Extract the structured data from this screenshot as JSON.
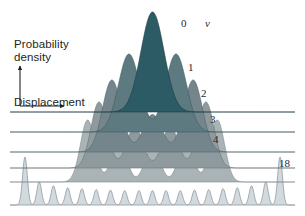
{
  "figure": {
    "background_color": "#ffffff",
    "axes": {
      "y_label": "Probability\ndensity",
      "y_label_line1": "Probability",
      "y_label_line2": "density",
      "x_label": "Displacement",
      "axis_color": "#231f20",
      "y_arrow_icon": "up-arrow-icon",
      "x_arrow_icon": "right-arrow-icon"
    },
    "quantum_number_symbol": "v",
    "labels": [
      {
        "text": "0",
        "x": 181,
        "y": 18,
        "name": "curve-label-v0"
      },
      {
        "text": "v",
        "x": 205,
        "y": 18,
        "name": "quantum-number-symbol",
        "italic": true
      },
      {
        "text": "1",
        "x": 188,
        "y": 62,
        "name": "curve-label-v1"
      },
      {
        "text": "2",
        "x": 201,
        "y": 88,
        "name": "curve-label-v2"
      },
      {
        "text": "3",
        "x": 210,
        "y": 114,
        "name": "curve-label-v3"
      },
      {
        "text": "4",
        "x": 213,
        "y": 134,
        "name": "curve-label-v4"
      },
      {
        "text": "18",
        "x": 279,
        "y": 158,
        "name": "curve-label-v18"
      }
    ]
  },
  "chart_data": {
    "type": "area",
    "xlabel": "Displacement",
    "ylabel": "Probability density",
    "grid": false,
    "legend": "inline right-edge labels",
    "xlim": [
      -1.0,
      1.0
    ],
    "ylim": [
      0,
      1
    ],
    "quantum_number_symbol": "v",
    "series": [
      {
        "name": "0",
        "v": 0,
        "lobes": 1,
        "fill_color": "#2c5b66",
        "stroke_color": "#1d3d45",
        "baseline_y": 112,
        "peak_height": 100,
        "half_width": 0.115,
        "peak_positions": [
          0.0
        ],
        "peak_amplitudes": [
          1.0
        ]
      },
      {
        "name": "1",
        "v": 1,
        "lobes": 2,
        "fill_color": "#5d7a80",
        "stroke_color": "#3e5c63",
        "baseline_y": 132,
        "peak_height": 78,
        "half_width": 0.105,
        "peak_positions": [
          -0.165,
          0.165
        ],
        "peak_amplitudes": [
          1.0,
          1.0
        ]
      },
      {
        "name": "2",
        "v": 2,
        "lobes": 3,
        "fill_color": "#74868c",
        "stroke_color": "#52676e",
        "baseline_y": 152,
        "peak_height": 72,
        "half_width": 0.093,
        "peak_positions": [
          -0.285,
          0.0,
          0.285
        ],
        "peak_amplitudes": [
          1.0,
          0.52,
          1.0
        ]
      },
      {
        "name": "3",
        "v": 3,
        "lobes": 4,
        "fill_color": "#8e9a9e",
        "stroke_color": "#687579",
        "baseline_y": 168,
        "peak_height": 66,
        "half_width": 0.081,
        "peak_positions": [
          -0.375,
          -0.125,
          0.125,
          0.375
        ],
        "peak_amplitudes": [
          1.0,
          0.62,
          0.62,
          1.0
        ]
      },
      {
        "name": "4",
        "v": 4,
        "lobes": 5,
        "fill_color": "#aab3b6",
        "stroke_color": "#808b8f",
        "baseline_y": 182,
        "peak_height": 62,
        "half_width": 0.072,
        "peak_positions": [
          -0.455,
          -0.235,
          0.0,
          0.235,
          0.455
        ],
        "peak_amplitudes": [
          1.0,
          0.68,
          0.6,
          0.68,
          1.0
        ]
      },
      {
        "name": "18",
        "v": 18,
        "lobes": 19,
        "fill_color": "#d3dade",
        "stroke_color": "#8d9ba2",
        "baseline_y": 205,
        "peak_height": 48,
        "half_width": 0.0235,
        "peak_positions": [
          -0.895,
          -0.795,
          -0.695,
          -0.595,
          -0.495,
          -0.395,
          -0.295,
          -0.195,
          -0.095,
          0.0,
          0.095,
          0.195,
          0.295,
          0.395,
          0.495,
          0.595,
          0.695,
          0.795,
          0.895
        ],
        "peak_amplitudes": [
          1.0,
          0.48,
          0.4,
          0.36,
          0.34,
          0.32,
          0.31,
          0.3,
          0.3,
          0.3,
          0.3,
          0.3,
          0.31,
          0.32,
          0.34,
          0.36,
          0.4,
          0.48,
          1.0
        ]
      }
    ]
  }
}
